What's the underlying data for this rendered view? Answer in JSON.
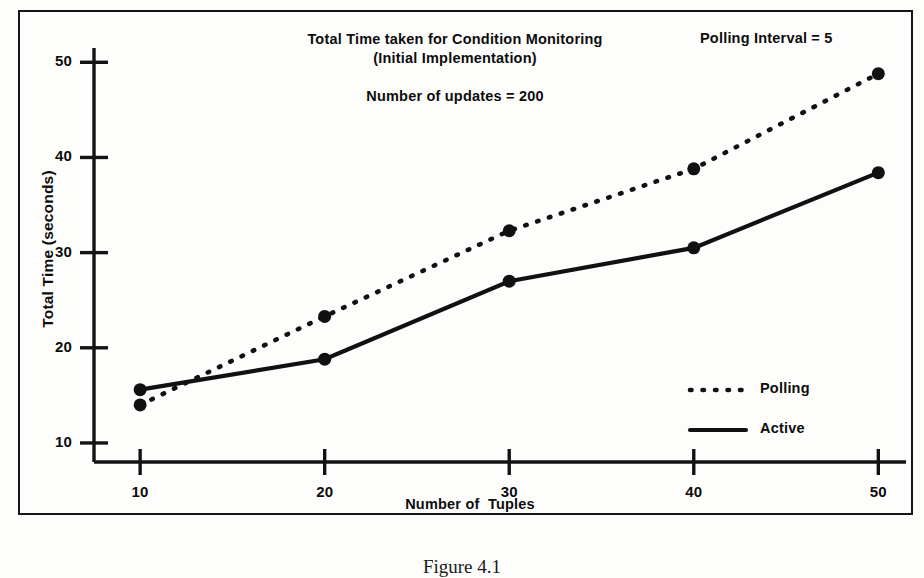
{
  "figure": {
    "caption": "Figure 4.1"
  },
  "chart_data": {
    "type": "line",
    "title_line1": "Total Time taken for Condition Monitoring",
    "title_line2": "(Initial Implementation)",
    "subtitle": "Number of updates = 200",
    "annotation": "Polling Interval = 5",
    "xlabel": "Number of  Tuples",
    "ylabel": "Total Time (seconds)",
    "x": [
      10,
      20,
      30,
      40,
      50
    ],
    "xticks": [
      "10",
      "20",
      "30",
      "40",
      "50"
    ],
    "yticks": [
      "10",
      "20",
      "30",
      "40",
      "50"
    ],
    "xlim": [
      7.5,
      51.5
    ],
    "ylim": [
      8.0,
      51.5
    ],
    "grid": false,
    "legend_position": "bottom-right",
    "series": [
      {
        "name": "Polling",
        "style": "dotted",
        "values": [
          14.0,
          23.3,
          32.3,
          38.8,
          48.8
        ]
      },
      {
        "name": "Active",
        "style": "solid",
        "values": [
          15.6,
          18.8,
          27.0,
          30.5,
          38.4
        ]
      }
    ]
  },
  "legend": {
    "items": [
      {
        "label": "Polling",
        "style": "dotted"
      },
      {
        "label": "Active",
        "style": "solid"
      }
    ]
  }
}
